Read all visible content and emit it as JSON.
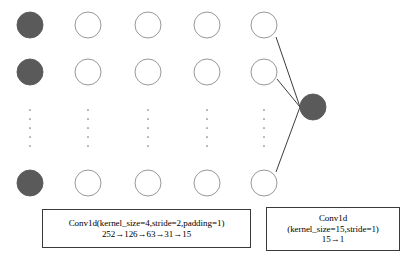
{
  "diagram": {
    "colors": {
      "node_fill_dark": "#5a5a5a",
      "node_fill_light": "#ffffff",
      "node_stroke": "#8c8c8c",
      "edge_stroke": "#262626",
      "box_stroke": "#3a3a3a",
      "background": "#ffffff",
      "dot_color": "#7a7a7a"
    },
    "layers": [
      {
        "name": "input-layer",
        "fill": "dark",
        "cx": 30,
        "nodes": [
          {
            "cy": 25
          },
          {
            "cy": 72
          },
          {
            "cy": 183
          }
        ],
        "ellipsis_y": 128
      },
      {
        "name": "hidden-layer-1",
        "fill": "light",
        "cx": 88,
        "nodes": [
          {
            "cy": 25
          },
          {
            "cy": 72
          },
          {
            "cy": 183
          }
        ],
        "ellipsis_y": 128
      },
      {
        "name": "hidden-layer-2",
        "fill": "light",
        "cx": 148,
        "nodes": [
          {
            "cy": 25
          },
          {
            "cy": 72
          },
          {
            "cy": 183
          }
        ],
        "ellipsis_y": 128
      },
      {
        "name": "hidden-layer-3",
        "fill": "light",
        "cx": 207,
        "nodes": [
          {
            "cy": 25
          },
          {
            "cy": 72
          },
          {
            "cy": 183
          }
        ],
        "ellipsis_y": 128
      },
      {
        "name": "hidden-layer-4",
        "fill": "light",
        "cx": 264,
        "nodes": [
          {
            "cy": 25
          },
          {
            "cy": 72
          },
          {
            "cy": 183
          }
        ],
        "ellipsis_y": 128
      }
    ],
    "output_node": {
      "name": "output-node",
      "fill": "dark",
      "cx": 313,
      "cy": 107,
      "r": 13
    },
    "node_radius": 13,
    "edges": [
      {
        "x1": 276,
        "y1": 37,
        "x2": 300,
        "y2": 107
      },
      {
        "x1": 277,
        "y1": 79,
        "x2": 300,
        "y2": 107
      },
      {
        "x1": 276,
        "y1": 172,
        "x2": 300,
        "y2": 107
      }
    ],
    "ellipsis_dot_count": 5
  },
  "left_caption": {
    "name": "conv-block-1-caption",
    "line1": "Conv1d(kernel_size=4,stride=2,padding=1)",
    "line2": "252→126→63→31→15"
  },
  "right_caption": {
    "name": "conv-block-2-caption",
    "line1": "Conv1d",
    "line2": "(kernel_size=15,stride=1)",
    "line3": "15→1"
  }
}
